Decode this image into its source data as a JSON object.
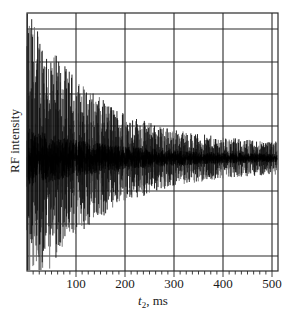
{
  "chart_data": {
    "type": "line",
    "title": "",
    "xlabel": "t2, ms",
    "xlabel_main": "t",
    "xlabel_sub": "2",
    "xlabel_unit": ", ms",
    "ylabel": "RF intensity",
    "xlim": [
      0,
      512
    ],
    "ylim": [
      -1,
      1
    ],
    "x_ticks": [
      100,
      200,
      300,
      400,
      500
    ],
    "x_tick_labels": [
      "100",
      "200",
      "300",
      "400",
      "500"
    ],
    "x_minor_tick_step": 12.5,
    "grid": true,
    "grid_x": [
      100,
      200,
      300,
      400,
      500
    ],
    "grid_y_count": 8,
    "legend": null,
    "series": [
      {
        "name": "Free induction decay",
        "description": "Noisy oscillating signal whose envelope decays roughly exponentially with t2",
        "envelope": {
          "initial_amplitude": 0.95,
          "decay_time_ms": 140,
          "noise_floor": 0.09
        },
        "baseline": 0.0,
        "samples": 640,
        "color": "#111111"
      }
    ]
  },
  "colors": {
    "background": "#ffffff",
    "grid": "#2a2a2a",
    "trace": "#111111",
    "trace_gray": "#6a6a6a"
  }
}
